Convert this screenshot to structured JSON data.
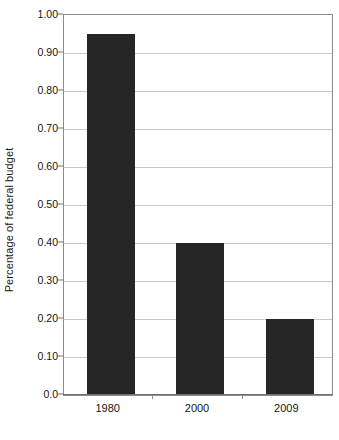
{
  "chart_data": {
    "type": "bar",
    "title": "",
    "subtitle": "",
    "xlabel": "",
    "ylabel": "Percentage of federal budget",
    "categories": [
      "1980",
      "2000",
      "2009"
    ],
    "values": [
      0.95,
      0.4,
      0.2
    ],
    "series": [
      {
        "name": "Percentage of federal budget",
        "values": [
          0.95,
          0.4,
          0.2
        ]
      }
    ],
    "ylim": [
      0.0,
      1.0
    ],
    "y_ticks": [
      0.0,
      0.1,
      0.2,
      0.3,
      0.4,
      0.5,
      0.6,
      0.7,
      0.8,
      0.9,
      1.0
    ],
    "y_tick_labels": [
      "0.0",
      "0.10",
      "0.20",
      "0.30",
      "0.40",
      "0.50",
      "0.60",
      "0.70",
      "0.80",
      "0.90",
      "1.00"
    ],
    "grid": true,
    "grid_axis": "y",
    "legend": false,
    "legend_position": "none",
    "bar_color": "#262626",
    "grid_color": "#c9c9c9",
    "frame_color": "#8c8c8c",
    "background_color": "#ffffff",
    "annotations": []
  },
  "colors": {
    "bar": "#262626",
    "grid": "#c9c9c9",
    "frame": "#8c8c8c",
    "axis": "#6f6f6f",
    "text": "#151515",
    "background": "#ffffff"
  }
}
